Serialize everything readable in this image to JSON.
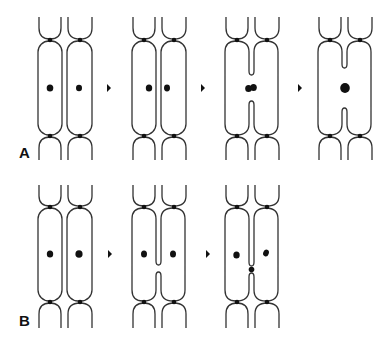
{
  "figure": {
    "rows": [
      {
        "label": "A",
        "stages": [
          {
            "name": "two separate cells",
            "nuclei": 2,
            "septum": "complete"
          },
          {
            "name": "nuclei approach septum",
            "nuclei": 2,
            "septum": "complete"
          },
          {
            "name": "septum opens, nuclei meet",
            "nuclei": 2,
            "septum": "opening"
          },
          {
            "name": "fused cell with single nucleus",
            "nuclei": 1,
            "septum": "wide opening"
          }
        ]
      },
      {
        "label": "B",
        "stages": [
          {
            "name": "two separate cells",
            "nuclei": 2,
            "septum": "complete"
          },
          {
            "name": "septum opens narrowly",
            "nuclei": 2,
            "septum": "small gap"
          },
          {
            "name": "pore with dot in septum",
            "nuclei": 2,
            "septum": "pore"
          }
        ]
      }
    ],
    "colors": {
      "line": "#333333",
      "fill": "#111111",
      "background": "#ffffff"
    }
  }
}
